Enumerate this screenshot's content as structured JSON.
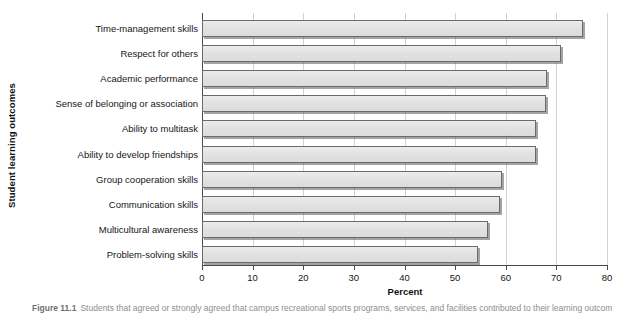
{
  "figure": {
    "caption_label": "Figure 11.1",
    "caption_text": "Students that agreed or strongly agreed that campus recreational sports programs, services, and facilities contributed to their learning outcomes"
  },
  "chart_data": {
    "type": "bar",
    "orientation": "horizontal",
    "title": "",
    "xlabel": "Percent",
    "ylabel": "Student learning outcomes",
    "xlim": [
      0,
      80
    ],
    "xticks": [
      0,
      10,
      20,
      30,
      40,
      50,
      60,
      70,
      80
    ],
    "xtick_labels": [
      "0",
      "10",
      "20",
      "30",
      "40",
      "50",
      "60",
      "70",
      "80"
    ],
    "grid": "vertical",
    "legend": "none",
    "bar_color": "#e2e2e2",
    "bar_edge_color": "#6a6a6a",
    "categories": [
      "Time-management skills",
      "Respect for others",
      "Academic performance",
      "Sense of belonging or association",
      "Ability to multitask",
      "Ability to develop friendships",
      "Group cooperation skills",
      "Communication skills",
      "Multicultural awareness",
      "Problem-solving skills"
    ],
    "values": [
      75.3,
      71.0,
      68.2,
      68.0,
      66.0,
      66.0,
      59.3,
      58.8,
      56.5,
      54.6
    ]
  }
}
